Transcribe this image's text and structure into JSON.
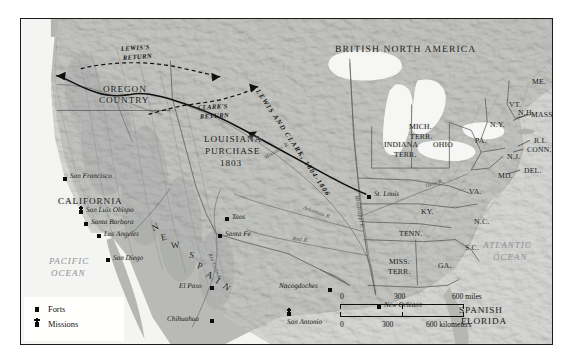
{
  "map": {
    "title": "Louisiana Purchase and the Lewis and Clark Expedition",
    "frame_color": "#1b1b1b",
    "land_color": "#b9bab6",
    "water_color": "#f3f3f1",
    "territory_colors": {
      "louisiana_purchase": "#c6c7c3",
      "united_states": "#a9aaa6",
      "new_spain": "#c2c3bf",
      "british_north_america": "#b0b1ad"
    }
  },
  "regions": [
    {
      "name": "british-north-america",
      "label": "BRITISH NORTH AMERICA",
      "x": 314,
      "y": 26,
      "cls": "country-hdr"
    },
    {
      "name": "oregon-country",
      "label": "OREGON",
      "x": 82,
      "y": 66,
      "cls": "big-region"
    },
    {
      "name": "oregon-country-2",
      "label": "COUNTRY",
      "x": 78,
      "y": 77,
      "cls": "big-region"
    },
    {
      "name": "louisiana-purchase",
      "label": "LOUISIANA",
      "x": 183,
      "y": 116,
      "cls": "big-region"
    },
    {
      "name": "louisiana-purchase-2",
      "label": "PURCHASE",
      "x": 184,
      "y": 128,
      "cls": "big-region"
    },
    {
      "name": "louisiana-purchase-year",
      "label": "1803",
      "x": 199,
      "y": 140,
      "cls": "big-region"
    },
    {
      "name": "california",
      "label": "CALIFORNIA",
      "x": 37,
      "y": 178,
      "cls": "big-region"
    },
    {
      "name": "spanish-florida",
      "label": "SPANISH",
      "x": 438,
      "y": 287,
      "cls": "big-region"
    },
    {
      "name": "spanish-florida-2",
      "label": "FLORIDA",
      "x": 440,
      "y": 298,
      "cls": "big-region"
    }
  ],
  "new_spain_letters": [
    {
      "ch": "N",
      "x": 131,
      "y": 204,
      "rot": -22
    },
    {
      "ch": "E",
      "x": 140,
      "y": 214,
      "rot": -14
    },
    {
      "ch": "W",
      "x": 150,
      "y": 222,
      "rot": -6
    },
    {
      "ch": "S",
      "x": 168,
      "y": 232,
      "rot": 10
    },
    {
      "ch": "P",
      "x": 176,
      "y": 243,
      "rot": 18
    },
    {
      "ch": "A",
      "x": 185,
      "y": 252,
      "rot": 26
    },
    {
      "ch": "I",
      "x": 195,
      "y": 258,
      "rot": 32
    },
    {
      "ch": "N",
      "x": 202,
      "y": 264,
      "rot": 38
    }
  ],
  "states": [
    {
      "name": "mich-terr",
      "label": "MICH.",
      "x": 388,
      "y": 104
    },
    {
      "name": "mich-terr-2",
      "label": "TERR.",
      "x": 389,
      "y": 114
    },
    {
      "name": "indiana-terr",
      "label": "INDIANA",
      "x": 363,
      "y": 122
    },
    {
      "name": "indiana-terr-2",
      "label": "TERR.",
      "x": 373,
      "y": 132
    },
    {
      "name": "ohio",
      "label": "OHIO",
      "x": 412,
      "y": 122
    },
    {
      "name": "pa",
      "label": "PA.",
      "x": 454,
      "y": 118
    },
    {
      "name": "ny",
      "label": "N.Y.",
      "x": 469,
      "y": 102
    },
    {
      "name": "me",
      "label": "ME.",
      "x": 511,
      "y": 59
    },
    {
      "name": "vt",
      "label": "VT.",
      "x": 488,
      "y": 82
    },
    {
      "name": "nh",
      "label": "N.H.",
      "x": 497,
      "y": 90
    },
    {
      "name": "mass",
      "label": "MASS.",
      "x": 522,
      "y": 92
    },
    {
      "name": "ri",
      "label": "R.I.",
      "x": 519,
      "y": 118
    },
    {
      "name": "conn",
      "label": "CONN.",
      "x": 511,
      "y": 127
    },
    {
      "name": "nj",
      "label": "N.J.",
      "x": 486,
      "y": 134
    },
    {
      "name": "del",
      "label": "DEL.",
      "x": 503,
      "y": 148
    },
    {
      "name": "md",
      "label": "MD.",
      "x": 477,
      "y": 153
    },
    {
      "name": "va",
      "label": "VA.",
      "x": 448,
      "y": 169
    },
    {
      "name": "ky",
      "label": "KY.",
      "x": 400,
      "y": 189
    },
    {
      "name": "nc",
      "label": "N.C.",
      "x": 453,
      "y": 199
    },
    {
      "name": "tenn",
      "label": "TENN.",
      "x": 378,
      "y": 211
    },
    {
      "name": "sc",
      "label": "S.C.",
      "x": 444,
      "y": 225
    },
    {
      "name": "miss-terr",
      "label": "MISS.",
      "x": 368,
      "y": 239
    },
    {
      "name": "miss-terr-2",
      "label": "TERR.",
      "x": 367,
      "y": 249
    },
    {
      "name": "ga",
      "label": "GA.",
      "x": 417,
      "y": 243
    }
  ],
  "cities": [
    {
      "name": "san-francisco",
      "label": "San Francisco",
      "mx": 42,
      "my": 158,
      "lx": 49,
      "ly": 154,
      "type": "fort"
    },
    {
      "name": "san-luis-obispo",
      "label": "San Luis Obispo",
      "mx": 58,
      "my": 191,
      "lx": 65,
      "ly": 188,
      "type": "mission"
    },
    {
      "name": "santa-barbara",
      "label": "Santa Barbara",
      "mx": 63,
      "my": 203,
      "lx": 70,
      "ly": 200,
      "type": "fort"
    },
    {
      "name": "los-angeles",
      "label": "Los Angeles",
      "mx": 76,
      "my": 215,
      "lx": 83,
      "ly": 212,
      "type": "fort"
    },
    {
      "name": "san-diego",
      "label": "San Diego",
      "mx": 85,
      "my": 239,
      "lx": 92,
      "ly": 236,
      "type": "fort"
    },
    {
      "name": "el-paso",
      "label": "El Paso",
      "mx": 189,
      "my": 267,
      "lx": 162,
      "ly": 264,
      "type": "fort"
    },
    {
      "name": "chihuahua",
      "label": "Chihuahua",
      "mx": 189,
      "my": 300,
      "lx": 150,
      "ly": 297,
      "type": "fort"
    },
    {
      "name": "taos",
      "label": "Taos",
      "mx": 204,
      "my": 198,
      "lx": 210,
      "ly": 195,
      "type": "fort"
    },
    {
      "name": "santa-fe",
      "label": "Santa Fe",
      "mx": 197,
      "my": 215,
      "lx": 204,
      "ly": 212,
      "type": "fort"
    },
    {
      "name": "san-antonio",
      "label": "San Antonio",
      "mx": 266,
      "my": 293,
      "lx": 269,
      "ly": 299,
      "type": "mission"
    },
    {
      "name": "nacogdoches",
      "label": "Nacogdoches",
      "mx": 307,
      "my": 269,
      "lx": 262,
      "ly": 265,
      "type": "fort"
    },
    {
      "name": "new-orleans",
      "label": "New Orleans",
      "mx": 356,
      "my": 286,
      "lx": 363,
      "ly": 283,
      "type": "fort"
    },
    {
      "name": "st-louis",
      "label": "St. Louis",
      "mx": 346,
      "my": 176,
      "lx": 352,
      "ly": 173,
      "type": "fort"
    }
  ],
  "routes": [
    {
      "name": "lewis-return",
      "label": "LEWIS'S RETURN",
      "line1": "LEWIS'S",
      "line2": "RETURN",
      "x": 100,
      "y": 27
    },
    {
      "name": "clarks-return",
      "label": "CLARK'S RETURN",
      "line1": "CLARK'S",
      "line2": "RETURN",
      "x": 177,
      "y": 86
    },
    {
      "name": "lewis-and-clark-main",
      "label": "LEWIS AND CLARK, 1804-1806"
    }
  ],
  "rivers": [
    {
      "name": "missouri-river",
      "label": "Missouri R.",
      "x": 243,
      "y": 138,
      "rot": -32
    },
    {
      "name": "mississippi-river",
      "label": "Mississippi R.",
      "x": 337,
      "y": 196,
      "rot": 80
    },
    {
      "name": "arkansas-river",
      "label": "Arkansas R.",
      "x": 283,
      "y": 197,
      "rot": 20
    },
    {
      "name": "red-river",
      "label": "Red R.",
      "x": 272,
      "y": 227,
      "rot": 8
    },
    {
      "name": "rio-grande",
      "label": "Rio Grande",
      "x": 196,
      "y": 245,
      "rot": 68
    },
    {
      "name": "ohio-river",
      "label": "Ohio R.",
      "x": 404,
      "y": 172,
      "rot": -18
    }
  ],
  "oceans": [
    {
      "name": "pacific-ocean",
      "line1": "PACIFIC",
      "line2": "OCEAN",
      "x": 28,
      "y": 253
    },
    {
      "name": "atlantic-ocean",
      "line1": "ATLANTIC",
      "line2": "OCEAN",
      "x": 468,
      "y": 240
    }
  ],
  "legend": {
    "items": [
      {
        "name": "forts",
        "label": "Forts",
        "symbol": "square"
      },
      {
        "name": "missions",
        "label": "Missions",
        "symbol": "square-cross"
      }
    ]
  },
  "scale": {
    "miles": {
      "zero": "0",
      "mid": "300",
      "max": "600",
      "unit": "600 miles"
    },
    "kilometers": {
      "zero": "0",
      "mid": "300",
      "max": "600",
      "unit": "600 kilometers"
    },
    "miles_labels": [
      "0",
      "300",
      "600 miles"
    ],
    "km_labels": [
      "0",
      "300",
      "600 kilometers"
    ]
  },
  "caption": {
    "text": ""
  }
}
